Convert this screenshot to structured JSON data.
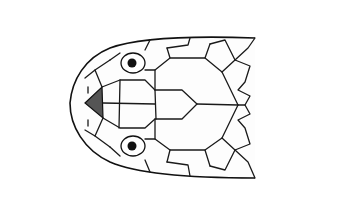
{
  "figure": {
    "background": "#ffffff",
    "stroke_color": "#1a1a1a",
    "shaded_scale_color": "#555555"
  }
}
